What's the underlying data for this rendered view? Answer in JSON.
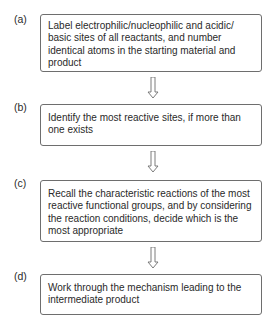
{
  "flowchart": {
    "steps": [
      {
        "label": "(a)",
        "text": "Label electrophilic/nucleophilic and acidic/ basic sites of all reactants, and number identical atoms in the starting material and product"
      },
      {
        "label": "(b)",
        "text": "Identify the most reactive sites, if more than one exists"
      },
      {
        "label": "(c)",
        "text": "Recall the characteristic reactions of the most reactive functional groups, and by considering the reaction conditions, decide which is the most appropriate"
      },
      {
        "label": "(d)",
        "text": "Work through the mechanism leading to the intermediate product"
      }
    ],
    "arrow_icon": "hollow-down-arrow",
    "colors": {
      "border": "#6e6e6e",
      "text": "#2a2a2a",
      "background": "#ffffff"
    }
  }
}
